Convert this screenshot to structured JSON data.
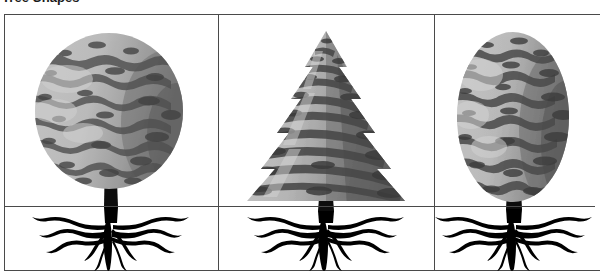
{
  "figure": {
    "title": "Tree Shapes",
    "frame_color": "#4a4a4a",
    "background_color": "#ffffff"
  },
  "palette": {
    "foliage_light": "#b9b9b9",
    "foliage_mid": "#9a9a9a",
    "foliage_dark": "#5a5a5a",
    "foliage_shadow": "#3d3d3d",
    "trunk": "#0d0d0d",
    "root": "#000000",
    "line": "#4a4a4a"
  },
  "panels": [
    {
      "id": "panel-round-tree",
      "label": "Round deciduous tree",
      "crown_shape": "round",
      "crown_label": "Rounded broadleaf canopy",
      "root_label": "Wide shallow spreading root system",
      "trunk_label": "Short forked trunk"
    },
    {
      "id": "panel-conifer-tree",
      "label": "Conical conifer tree",
      "crown_shape": "conical",
      "crown_label": "Conical evergreen canopy",
      "root_label": "Wide shallow spreading root system",
      "trunk_label": "Straight central trunk"
    },
    {
      "id": "panel-oval-tree",
      "label": "Oval deciduous tree",
      "crown_shape": "oval",
      "crown_label": "Upright oval broadleaf canopy",
      "root_label": "Wide shallow spreading root system",
      "trunk_label": "Short forked trunk"
    }
  ]
}
